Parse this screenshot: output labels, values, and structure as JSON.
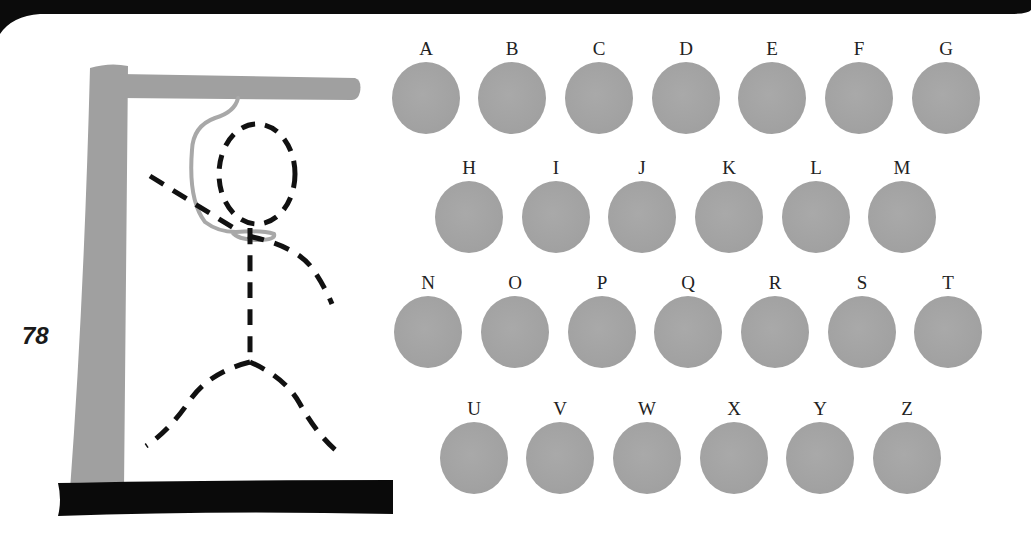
{
  "page": {
    "page_number": "78"
  },
  "game": {
    "type": "hangman",
    "colors": {
      "gallows_post": "#a0a0a0",
      "base": "#0a0a0a",
      "rope": "#a8a8a8",
      "figure": "#111111",
      "letter_disc": "#a3a3a3",
      "letter_text": "#222222"
    },
    "letter_rows": [
      [
        "A",
        "B",
        "C",
        "D",
        "E",
        "F",
        "G"
      ],
      [
        "H",
        "I",
        "J",
        "K",
        "L",
        "M"
      ],
      [
        "N",
        "O",
        "P",
        "Q",
        "R",
        "S",
        "T"
      ],
      [
        "U",
        "V",
        "W",
        "X",
        "Y",
        "Z"
      ]
    ]
  }
}
